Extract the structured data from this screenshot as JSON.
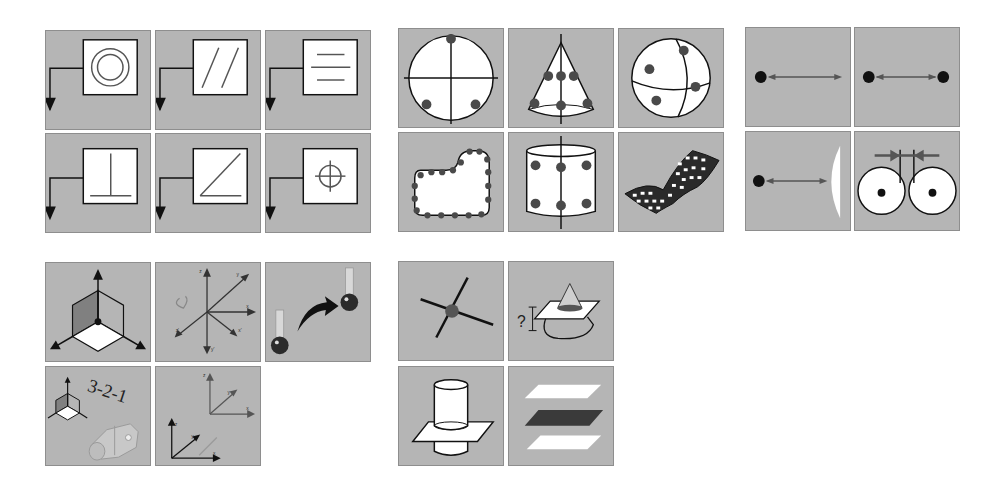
{
  "colors": {
    "tile_bg": "#b5b5b5",
    "tile_border": "#8e8e8e",
    "line": "#111111",
    "feature_line": "#555555",
    "point": "#4a4a4a",
    "white": "#ffffff"
  },
  "groups": [
    {
      "name": "constraint-tolerances",
      "tiles": [
        {
          "icon": "concentricity-icon"
        },
        {
          "icon": "parallelism-icon"
        },
        {
          "icon": "flatness-icon"
        },
        {
          "icon": "perpendicularity-icon"
        },
        {
          "icon": "angularity-icon"
        },
        {
          "icon": "position-icon"
        }
      ]
    },
    {
      "name": "geometric-features",
      "tiles": [
        {
          "icon": "circle-feature-icon"
        },
        {
          "icon": "cone-feature-icon"
        },
        {
          "icon": "sphere-feature-icon"
        },
        {
          "icon": "curve-feature-icon"
        },
        {
          "icon": "cylinder-feature-icon"
        },
        {
          "icon": "surface-feature-icon"
        }
      ]
    },
    {
      "name": "distance-constructs",
      "tiles": [
        {
          "icon": "point-distance-icon"
        },
        {
          "icon": "point-to-point-distance-icon"
        },
        {
          "icon": "point-to-surface-distance-icon"
        },
        {
          "icon": "circle-gap-distance-icon"
        }
      ]
    },
    {
      "name": "alignment-tools",
      "tiles": [
        {
          "icon": "coordinate-system-icon"
        },
        {
          "icon": "rotate-axes-icon"
        },
        {
          "icon": "move-probe-icon"
        },
        {
          "icon": "alignment-321-icon",
          "label": "3-2-1"
        },
        {
          "icon": "translate-frame-icon"
        }
      ],
      "axis_labels": {
        "rotate": [
          "z",
          "y",
          "x",
          "x'",
          "z'",
          "y'"
        ],
        "translate": [
          "z",
          "y",
          "x"
        ]
      }
    },
    {
      "name": "construction-tools",
      "tiles": [
        {
          "icon": "intersection-point-icon"
        },
        {
          "icon": "cone-plane-section-icon",
          "label": "?"
        },
        {
          "icon": "cylinder-plane-intersection-icon"
        },
        {
          "icon": "mid-plane-icon"
        }
      ]
    }
  ]
}
